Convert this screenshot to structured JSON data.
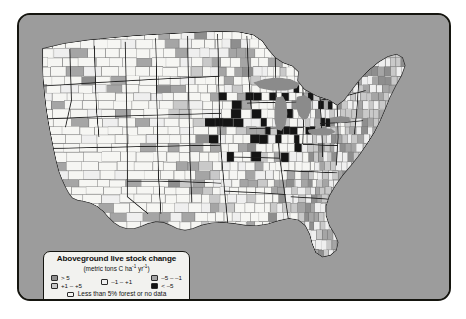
{
  "figure": {
    "kind": "choropleth-map",
    "region": "Contiguous United States, county level"
  },
  "legend": {
    "title": "Aboveground live stock change",
    "subtitle_prefix": "(metric tons C ha",
    "subtitle_exp1": "-1",
    "subtitle_mid": " yr",
    "subtitle_exp2": "-1",
    "subtitle_suffix": ")",
    "subtitle_plain": "(metric tons C ha-1 yr-1)",
    "classes": [
      {
        "label": "> 5",
        "color": "#8e8e8e",
        "column": 1
      },
      {
        "label": "+1 – +5",
        "color": "#c9c9c9",
        "column": 1
      },
      {
        "label": "–1 – +1",
        "color": "#efefef",
        "column": 2
      },
      {
        "label": "–5 – –1",
        "color": "#a5a5a5",
        "column": 3
      },
      {
        "label": "< –5",
        "color": "#141414",
        "column": 3
      }
    ],
    "nodata": {
      "label": "Less than 5% forest or no data",
      "color": "#f6f6f3"
    }
  },
  "colors": {
    "ocean": "#9c9c9c",
    "lakes": "#8b8b8b",
    "frame_border": "#15150f",
    "page_background": "#ffffff",
    "county_outline": "#6f6f6f",
    "state_outline": "#1d1d1d"
  },
  "chart_data": {
    "type": "heatmap",
    "title": "Aboveground live stock change",
    "units": "metric tons C ha-1 yr-1",
    "classes": [
      "> 5",
      "+1 – +5",
      "–1 – +1",
      "–5 – –1",
      "< –5",
      "Less than 5% forest or no data"
    ],
    "class_colors": [
      "#8e8e8e",
      "#c9c9c9",
      "#efefef",
      "#a5a5a5",
      "#141414",
      "#f6f6f3"
    ]
  }
}
